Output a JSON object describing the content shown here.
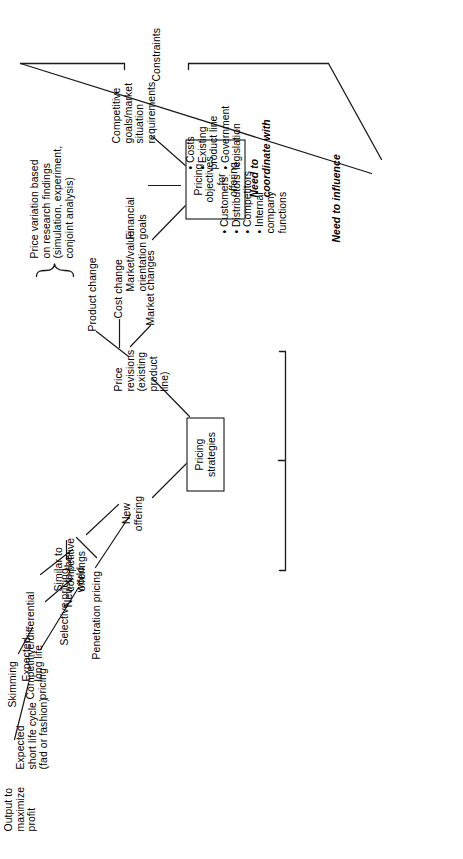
{
  "diagram": {
    "orientation": "rotated-90-ccw",
    "line_color": "#1a1a1a",
    "text_color": "#000000",
    "background": "#ffffff",
    "boxes": {
      "pricing_strategies": "Pricing\nstrategies",
      "pricing_objectives": "Pricing\nobjectives\nfor\noffering"
    },
    "strategies_branch": {
      "new_offering": "New\noffering",
      "new_to_the_world": "New-to-the-\nworld",
      "expected_short_life": "Expected\nshort life cycle\n(fad or fashion)",
      "output_to_maximize_profit": "Output to\nmaximize\nprofit",
      "expected_long_life": "Expected\nlong life",
      "skimming": "Skimming",
      "similar_to_competitive_offerings": "Similar  to\ncompetitive\nofferings",
      "competitive_differential_pricing": "Competitive/differential\npricing",
      "selective_pricing": "Selective pricing",
      "penetration_pricing": "Penetration pricing",
      "price_revisions": "Price\nrevisions\n(existing\nproduct\nline)",
      "product_change": "Product change",
      "cost_change": "Cost change",
      "market_changes": "Market changes",
      "price_variation": "Price variation based\non research findings\n(simulation, experiment,\nconjoint analysis)"
    },
    "objectives_branch": {
      "market_value_orientation": "Market/value\norientation",
      "financial_goals": "Financial\ngoals",
      "competitive_goals": "Competitive\ngoals/market\nsituation\nrequirements"
    },
    "constraints": {
      "label": "Constraints",
      "need_to_influence_heading": "Need to influence",
      "need_to_influence_items": [
        "Customers",
        "Distributors",
        "Competitors",
        "Internal\n  company\n  functions"
      ],
      "need_to_influence_text": "•  Customers\n•  Distributors\n•  Competitors\n•  Internal\n    company\n    functions",
      "need_to_coordinate_heading": "Need to\ncoordinate with",
      "need_to_coordinate_items": [
        "Costs",
        "Existing\n  product line",
        "Government\n  legislation"
      ],
      "need_to_coordinate_text": "•  Costs\n•  Existing\n    product line\n•  Government\n    legislation"
    }
  }
}
